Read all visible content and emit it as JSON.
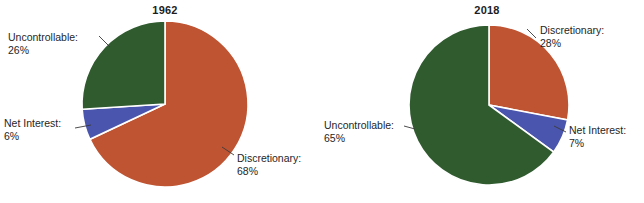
{
  "figure": {
    "background_color": "#ffffff",
    "text_color": "#262626"
  },
  "palette": {
    "discretionary": "#BF5433",
    "uncontrollable": "#2F5B2F",
    "net_interest": "#4A56AD",
    "slice_border": "#ffffff"
  },
  "charts": [
    {
      "id": "pie-1962",
      "title": "1962",
      "type": "pie",
      "center": {
        "x": 165,
        "y": 104
      },
      "radius": 83,
      "start_angle_deg": 0,
      "direction": "clockwise",
      "slices": [
        {
          "name": "Discretionary",
          "label": "Discretionary:",
          "pct_label": "68%",
          "value": 68,
          "color": "#BF5433"
        },
        {
          "name": "Net Interest",
          "label": "Net Interest:",
          "pct_label": "6%",
          "value": 6,
          "color": "#4A56AD"
        },
        {
          "name": "Uncontrollable",
          "label": "Uncontrollable:",
          "pct_label": "26%",
          "value": 26,
          "color": "#2F5B2F"
        }
      ]
    },
    {
      "id": "pie-2018",
      "title": "2018",
      "type": "pie",
      "center": {
        "x": 489,
        "y": 105
      },
      "radius": 80,
      "start_angle_deg": 0,
      "direction": "clockwise",
      "slices": [
        {
          "name": "Discretionary",
          "label": "Discretionary:",
          "pct_label": "28%",
          "value": 28,
          "color": "#BF5433"
        },
        {
          "name": "Net Interest",
          "label": "Net Interest:",
          "pct_label": "7%",
          "value": 7,
          "color": "#4A56AD"
        },
        {
          "name": "Uncontrollable",
          "label": "Uncontrollable:",
          "pct_label": "65%",
          "value": 65,
          "color": "#2F5B2F"
        }
      ]
    }
  ],
  "chart_data": {
    "type": "pie",
    "title": "",
    "charts": [
      {
        "title": "1962",
        "categories": [
          "Discretionary",
          "Net Interest",
          "Uncontrollable"
        ],
        "values": [
          68,
          6,
          26
        ],
        "value_labels": [
          "68%",
          "6%",
          "26%"
        ],
        "colors": [
          "#BF5433",
          "#4A56AD",
          "#2F5B2F"
        ]
      },
      {
        "title": "2018",
        "categories": [
          "Discretionary",
          "Net Interest",
          "Uncontrollable"
        ],
        "values": [
          28,
          7,
          65
        ],
        "value_labels": [
          "28%",
          "7%",
          "65%"
        ],
        "colors": [
          "#BF5433",
          "#4A56AD",
          "#2F5B2F"
        ]
      }
    ],
    "legend": "none (direct labels with leader lines)",
    "grid": false,
    "xlabel": "",
    "ylabel": ""
  }
}
